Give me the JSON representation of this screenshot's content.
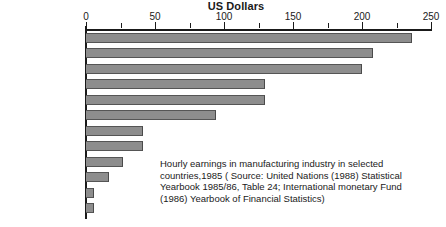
{
  "chart_data": {
    "type": "bar",
    "orientation": "horizontal",
    "title": "US Dollars",
    "xlabel": "US Dollars",
    "ylabel": "",
    "xlim": [
      0,
      250
    ],
    "grid": false,
    "legend": "none",
    "major_ticks": [
      0,
      50,
      100,
      150,
      200,
      250
    ],
    "minor_ticks": [
      25,
      75,
      125,
      175,
      225
    ],
    "tick_labels": [
      "0",
      "50",
      "100",
      "150",
      "200",
      "250"
    ],
    "categories": [
      "United States",
      "Canada",
      "Japan",
      "United Kingdom",
      "Ireland",
      "Spain",
      "Singapore",
      "South Korea",
      "Portugal",
      "Kenya",
      "Sri Lanka",
      "Bangladesh"
    ],
    "values": [
      236,
      208,
      200,
      130,
      130,
      94,
      41,
      41,
      27,
      17,
      6,
      6
    ],
    "bar_color": "#8d8d8d",
    "axis_color": "#1a1a1a",
    "background": "#ffffff"
  },
  "caption": {
    "line1": "Hourly earnings in manufacturing industry in selected",
    "line2": "countries,1985 ( Source: United Nations (1988) Statistical",
    "line3": "Yearbook 1985/86, Table 24; International monetary Fund",
    "line4": "(1986) Yearbook of Financial Statistics)"
  }
}
